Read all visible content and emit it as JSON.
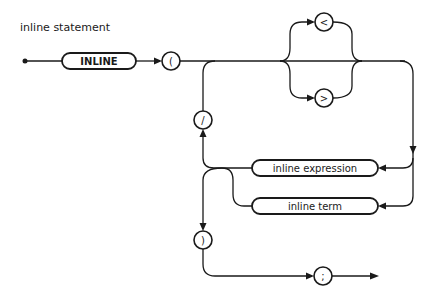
{
  "title": "inline statement",
  "nodes": {
    "start": {
      "type": "start-dot"
    },
    "keyword_inline": {
      "label": "INLINE",
      "type": "terminal-keyword"
    },
    "open_paren": {
      "label": "(",
      "type": "terminal-symbol"
    },
    "less_than": {
      "label": "<",
      "type": "terminal-symbol"
    },
    "greater_than": {
      "label": ">",
      "type": "terminal-symbol"
    },
    "slash": {
      "label": "/",
      "type": "terminal-symbol"
    },
    "inline_expression": {
      "label": "inline expression",
      "type": "nonterminal"
    },
    "inline_term": {
      "label": "inline term",
      "type": "nonterminal"
    },
    "close_paren": {
      "label": ")",
      "type": "terminal-symbol"
    },
    "semicolon": {
      "label": ";",
      "type": "terminal-symbol"
    }
  },
  "edges": [
    [
      "start",
      "keyword_inline"
    ],
    [
      "keyword_inline",
      "open_paren"
    ],
    [
      "open_paren",
      "less_than"
    ],
    [
      "open_paren",
      "greater_than"
    ],
    [
      "open_paren",
      "inline_expression"
    ],
    [
      "less_than",
      "inline_expression"
    ],
    [
      "greater_than",
      "inline_expression"
    ],
    [
      "open_paren",
      "inline_term"
    ],
    [
      "less_than",
      "inline_term"
    ],
    [
      "greater_than",
      "inline_term"
    ],
    [
      "inline_expression",
      "slash"
    ],
    [
      "inline_term",
      "slash"
    ],
    [
      "slash",
      "open_paren-junction"
    ],
    [
      "inline_expression",
      "close_paren"
    ],
    [
      "inline_term",
      "close_paren"
    ],
    [
      "close_paren",
      "semicolon"
    ],
    [
      "semicolon",
      "end"
    ]
  ],
  "colors": {
    "ink": "#1a1a1a",
    "background": "#ffffff"
  }
}
